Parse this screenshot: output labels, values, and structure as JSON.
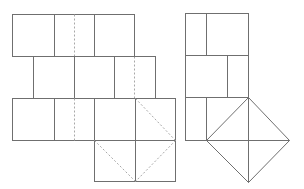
{
  "diagram": {
    "colors": {
      "solid_line": "#6f6f6f",
      "dashed_line": "#a8a8a8",
      "background": "#ffffff"
    },
    "left_figure": {
      "rows": [
        {
          "y": [
            14,
            56
          ],
          "x_edges": [
            12,
            134
          ],
          "solid_dividers": [
            54,
            94
          ],
          "dashed_dividers": [
            74
          ]
        },
        {
          "y": [
            56,
            98
          ],
          "x_edges": [
            33,
            155
          ],
          "solid_dividers": [
            74,
            114
          ],
          "dashed_dividers": [
            135
          ]
        },
        {
          "y": [
            98,
            141
          ],
          "x_edges": [
            12,
            176
          ],
          "solid_dividers": [
            54,
            94,
            135
          ],
          "dashed_dividers": [
            74
          ]
        }
      ],
      "bottom_square": {
        "x": [
          94,
          176
        ],
        "y": [
          141,
          182
        ],
        "center_divider": 135
      },
      "dashed_diagonals": [
        [
          135,
          98,
          176,
          140
        ],
        [
          176,
          140,
          135,
          182
        ],
        [
          94,
          141,
          135,
          182
        ]
      ]
    },
    "right_figure": {
      "rows": [
        {
          "y": [
            13,
            55
          ],
          "x_edges": [
            185,
            248
          ],
          "solid_dividers": [
            206
          ]
        },
        {
          "y": [
            55,
            97
          ],
          "x_edges": [
            185,
            248
          ],
          "solid_dividers": [
            227
          ]
        },
        {
          "y": [
            97,
            140
          ],
          "x_edges": [
            185,
            248
          ],
          "solid_dividers": [
            206
          ]
        }
      ],
      "diamond": [
        [
          248,
          97
        ],
        [
          289,
          140
        ],
        [
          248,
          182
        ],
        [
          206,
          140
        ]
      ],
      "extra_lines": [
        [
          248,
          140,
          289,
          140
        ],
        [
          248,
          140,
          248,
          182
        ]
      ]
    }
  }
}
